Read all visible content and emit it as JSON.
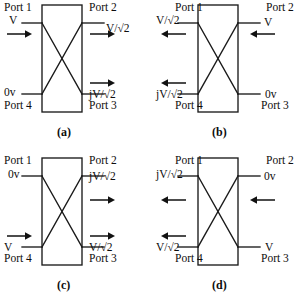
{
  "figure": {
    "line_color": "#1a1a1a",
    "background": "#ffffff"
  },
  "panels": [
    {
      "id": "a",
      "caption": "(a)",
      "ports": {
        "p1": "Port 1",
        "p2": "Port 2",
        "p3": "Port 3",
        "p4": "Port 4"
      },
      "values": {
        "p1": "V",
        "p2": "V/√2",
        "p3": "jV/√2",
        "p4": "0v"
      },
      "arrows": {
        "p1": "right",
        "p2": "right",
        "p3": "right",
        "p4": "none"
      }
    },
    {
      "id": "b",
      "caption": "(b)",
      "ports": {
        "p1": "Port 1",
        "p2": "Port 2",
        "p3": "Port 3",
        "p4": "Port 4"
      },
      "values": {
        "p1": "V/√2",
        "p2": "V",
        "p3": "0v",
        "p4": "jV/√2"
      },
      "arrows": {
        "p1": "left",
        "p2": "left",
        "p3": "none",
        "p4": "left"
      }
    },
    {
      "id": "c",
      "caption": "(c)",
      "ports": {
        "p1": "Port 1",
        "p2": "Port 2",
        "p3": "Port 3",
        "p4": "Port 4"
      },
      "values": {
        "p1": "0v",
        "p2": "jV/√2",
        "p3": "V/√2",
        "p4": "V"
      },
      "arrows": {
        "p1": "none",
        "p2": "right",
        "p3": "right",
        "p4": "right"
      }
    },
    {
      "id": "d",
      "caption": "(d)",
      "ports": {
        "p1": "Port 1",
        "p2": "Port 2",
        "p3": "Port 3",
        "p4": "Port 4"
      },
      "values": {
        "p1": "jV/√2",
        "p2": "0v",
        "p3": "V",
        "p4": "V/√2"
      },
      "arrows": {
        "p1": "left",
        "p2": "left",
        "p3": "none",
        "p4": "left"
      }
    }
  ]
}
